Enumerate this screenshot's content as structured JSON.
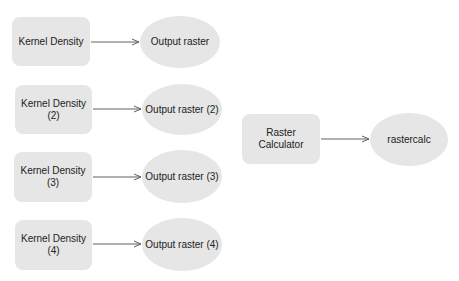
{
  "diagram": {
    "tools": [
      {
        "id": "kd1",
        "label": "Kernel Density",
        "x": 12,
        "y": 17,
        "w": 78,
        "h": 49
      },
      {
        "id": "kd2",
        "label": "Kernel Density\n(2)",
        "x": 15,
        "y": 85,
        "w": 77,
        "h": 49
      },
      {
        "id": "kd3",
        "label": "Kernel Density\n(3)",
        "x": 14,
        "y": 152,
        "w": 78,
        "h": 50
      },
      {
        "id": "kd4",
        "label": "Kernel Density\n(4)",
        "x": 15,
        "y": 220,
        "w": 77,
        "h": 50
      },
      {
        "id": "rc",
        "label": "Raster\nCalculator",
        "x": 242,
        "y": 114,
        "w": 78,
        "h": 50
      }
    ],
    "outputs": [
      {
        "id": "o1",
        "label": "Output raster",
        "x": 140,
        "y": 16,
        "w": 80,
        "h": 52
      },
      {
        "id": "o2",
        "label": "Output raster (2)",
        "x": 142,
        "y": 84,
        "w": 80,
        "h": 51
      },
      {
        "id": "o3",
        "label": "Output raster (3)",
        "x": 142,
        "y": 150,
        "w": 80,
        "h": 53
      },
      {
        "id": "o4",
        "label": "Output raster (4)",
        "x": 142,
        "y": 218,
        "w": 80,
        "h": 53
      },
      {
        "id": "o5",
        "label": "rastercalc",
        "x": 370,
        "y": 113,
        "w": 78,
        "h": 53
      }
    ],
    "edges": [
      {
        "from": "kd1",
        "to": "o1",
        "x1": 91,
        "x2": 139,
        "y": 42
      },
      {
        "from": "kd2",
        "to": "o2",
        "x1": 93,
        "x2": 141,
        "y": 109
      },
      {
        "from": "kd3",
        "to": "o3",
        "x1": 93,
        "x2": 141,
        "y": 177
      },
      {
        "from": "kd4",
        "to": "o4",
        "x1": 93,
        "x2": 141,
        "y": 244
      },
      {
        "from": "rc",
        "to": "o5",
        "x1": 321,
        "x2": 369,
        "y": 139
      }
    ],
    "colors": {
      "node_fill": "#e6e6e6",
      "edge": "#606060",
      "text": "#222222"
    }
  }
}
